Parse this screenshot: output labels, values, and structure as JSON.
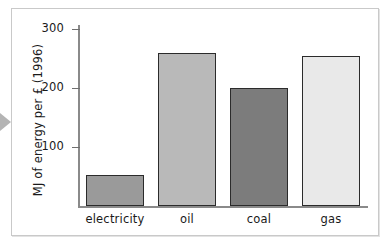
{
  "chart_data": {
    "type": "bar",
    "title": "",
    "subtitle": "",
    "xlabel": "",
    "ylabel": "MJ of energy per £ (1996)",
    "categories": [
      "electricity",
      "oil",
      "coal",
      "gas"
    ],
    "values": [
      52,
      260,
      200,
      255
    ],
    "series": [
      {
        "name": "MJ of energy per £ (1996)",
        "values": [
          52,
          260,
          200,
          255
        ]
      }
    ],
    "ylim": [
      0,
      320
    ],
    "yticks": [
      100,
      200,
      300
    ],
    "ytick_labels": [
      "100",
      "200",
      "300"
    ],
    "grid": false,
    "legend": false,
    "legend_position": "none",
    "bar_colors": [
      "#9a9a9a",
      "#b9b9b9",
      "#7c7c7c",
      "#e9e9e9"
    ],
    "bar_edge_color": "#2b2b2b",
    "axis_color": "#8a8a8a"
  },
  "figure": {
    "frame_color": "#c9c9c9",
    "background": "#ffffff",
    "margin_arrow_color": "#b4b4b4"
  },
  "axes": {
    "y_title": "MJ of energy per £ (1996)",
    "ticks": [
      {
        "label": "300",
        "value": 300
      },
      {
        "label": "200",
        "value": 200
      },
      {
        "label": "100",
        "value": 100
      }
    ]
  },
  "bars": [
    {
      "label": "electricity",
      "value": 52,
      "color": "#9a9a9a"
    },
    {
      "label": "oil",
      "value": 260,
      "color": "#b9b9b9"
    },
    {
      "label": "coal",
      "value": 200,
      "color": "#7c7c7c"
    },
    {
      "label": "gas",
      "value": 255,
      "color": "#e9e9e9"
    }
  ]
}
